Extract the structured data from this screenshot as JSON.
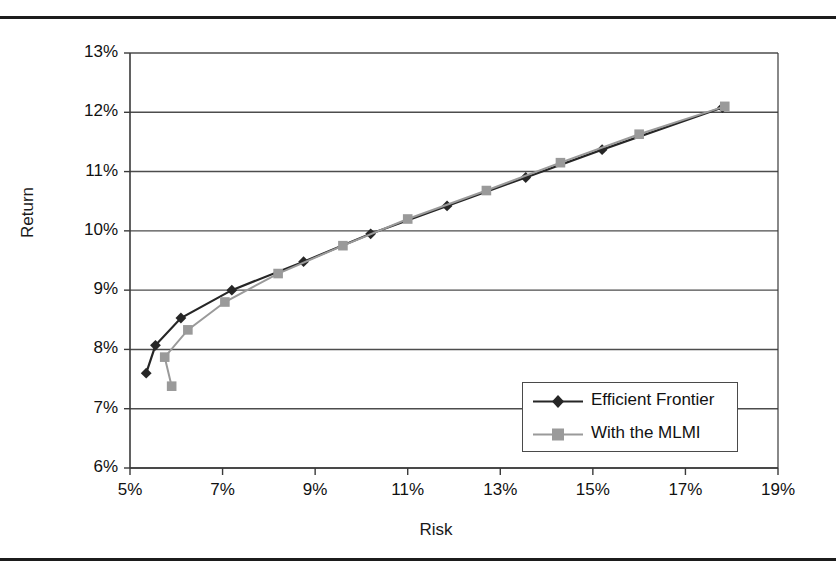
{
  "page": {
    "rules": [
      "page-rule-top",
      "page-rule-bottom"
    ]
  },
  "chart_data": {
    "type": "line",
    "title": "",
    "xlabel": "Risk",
    "ylabel": "Return",
    "xlim": [
      5,
      19
    ],
    "ylim": [
      6,
      13
    ],
    "grid": "horizontal",
    "x_tick_labels": [
      "5%",
      "7%",
      "9%",
      "11%",
      "13%",
      "15%",
      "17%",
      "19%"
    ],
    "x_tick_values": [
      5,
      7,
      9,
      11,
      13,
      15,
      17,
      19
    ],
    "y_tick_labels": [
      "6%",
      "7%",
      "8%",
      "9%",
      "10%",
      "11%",
      "12%",
      "13%"
    ],
    "y_tick_values": [
      6,
      7,
      8,
      9,
      10,
      11,
      12,
      13
    ],
    "legend_position": "inside-lower-right",
    "series": [
      {
        "name": "Efficient Frontier",
        "color": "#262626",
        "marker": "diamond",
        "points": [
          [
            5.35,
            7.6
          ],
          [
            5.55,
            8.07
          ],
          [
            6.1,
            8.53
          ],
          [
            7.2,
            9.0
          ],
          [
            8.75,
            9.48
          ],
          [
            10.2,
            9.95
          ],
          [
            11.85,
            10.42
          ],
          [
            13.55,
            10.9
          ],
          [
            15.2,
            11.37
          ],
          [
            17.8,
            12.08
          ]
        ]
      },
      {
        "name": "With the MLMI",
        "color": "#9a9a9a",
        "marker": "square",
        "points": [
          [
            5.9,
            7.38
          ],
          [
            5.75,
            7.87
          ],
          [
            6.25,
            8.33
          ],
          [
            7.05,
            8.8
          ],
          [
            8.2,
            9.28
          ],
          [
            9.6,
            9.75
          ],
          [
            11.0,
            10.2
          ],
          [
            12.7,
            10.68
          ],
          [
            14.3,
            11.15
          ],
          [
            16.0,
            11.63
          ],
          [
            17.85,
            12.1
          ]
        ]
      }
    ]
  },
  "axes": {
    "y_title": "Return",
    "x_title": "Risk"
  },
  "legend": {
    "entries": [
      {
        "label": "Efficient Frontier"
      },
      {
        "label": "With the MLMI"
      }
    ]
  },
  "colors": {
    "series_efficient_frontier": "#262626",
    "series_with_mlmi": "#9a9a9a",
    "gridline": "#4d4d4d",
    "axis": "#3a3a3a",
    "text": "#111111",
    "page_rule": "#1c1c1c"
  }
}
